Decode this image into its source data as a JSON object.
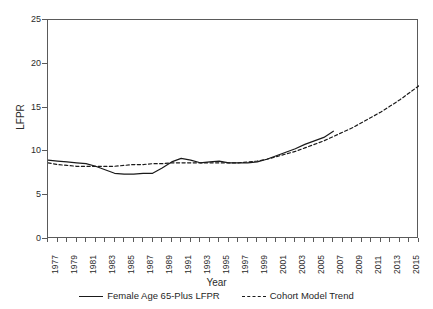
{
  "chart_data": {
    "type": "line",
    "title": "",
    "xlabel": "Year",
    "ylabel": "LFPR",
    "xlim": [
      1977,
      2016
    ],
    "ylim": [
      0,
      25
    ],
    "yticks": [
      0,
      5,
      10,
      15,
      20,
      25
    ],
    "xticks": [
      1977,
      1979,
      1981,
      1983,
      1985,
      1987,
      1989,
      1991,
      1993,
      1995,
      1997,
      1999,
      2001,
      2003,
      2005,
      2007,
      2009,
      2011,
      2013,
      2015
    ],
    "grid": false,
    "legend_position": "bottom",
    "series": [
      {
        "name": "Female Age 65-Plus LFPR",
        "style": "solid",
        "color": "#1a1a1a",
        "x": [
          1977,
          1978,
          1979,
          1980,
          1981,
          1982,
          1983,
          1984,
          1985,
          1986,
          1987,
          1988,
          1989,
          1990,
          1991,
          1992,
          1993,
          1994,
          1995,
          1996,
          1997,
          1998,
          1999,
          2000,
          2001,
          2002,
          2003,
          2004,
          2005,
          2006,
          2007
        ],
        "values": [
          9.0,
          8.9,
          8.8,
          8.7,
          8.6,
          8.3,
          7.9,
          7.5,
          7.4,
          7.4,
          7.5,
          7.5,
          8.1,
          8.8,
          9.2,
          9.0,
          8.7,
          8.8,
          8.9,
          8.7,
          8.7,
          8.7,
          8.8,
          9.1,
          9.5,
          9.9,
          10.3,
          10.8,
          11.2,
          11.6,
          12.3
        ]
      },
      {
        "name": "Cohort Model Trend",
        "style": "dashed",
        "color": "#1a1a1a",
        "x": [
          1977,
          1978,
          1979,
          1980,
          1981,
          1982,
          1983,
          1984,
          1985,
          1986,
          1987,
          1988,
          1989,
          1990,
          1991,
          1992,
          1993,
          1994,
          1995,
          1996,
          1997,
          1998,
          1999,
          2000,
          2001,
          2002,
          2003,
          2004,
          2005,
          2006,
          2007,
          2008,
          2009,
          2010,
          2011,
          2012,
          2013,
          2014,
          2015,
          2016
        ],
        "values": [
          8.7,
          8.5,
          8.4,
          8.3,
          8.3,
          8.3,
          8.3,
          8.3,
          8.4,
          8.5,
          8.5,
          8.6,
          8.6,
          8.7,
          8.7,
          8.7,
          8.7,
          8.7,
          8.7,
          8.7,
          8.7,
          8.8,
          8.9,
          9.1,
          9.4,
          9.7,
          10.0,
          10.4,
          10.8,
          11.2,
          11.7,
          12.2,
          12.7,
          13.3,
          13.9,
          14.5,
          15.2,
          15.9,
          16.7,
          17.5
        ]
      }
    ]
  },
  "axes": {
    "y_title": "LFPR",
    "x_title": "Year"
  },
  "legend": {
    "items": [
      {
        "label": "Female Age 65-Plus LFPR",
        "style": "solid"
      },
      {
        "label": "Cohort Model Trend",
        "style": "dashed"
      }
    ]
  }
}
